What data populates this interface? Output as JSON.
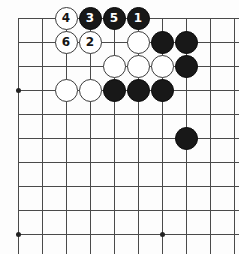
{
  "diagram": {
    "board": {
      "image_width": 239,
      "image_height": 254,
      "cell_size": 24,
      "origin_x": 18,
      "origin_y": 18,
      "columns": 10,
      "rows": 10,
      "line_color": "#4a4a4a",
      "background_color": "#fdfdfd",
      "black_color": "#181818",
      "white_color": "#ffffff"
    },
    "star_points": [
      {
        "col": 0,
        "row": 3
      },
      {
        "col": 0,
        "row": 9
      },
      {
        "col": 6,
        "row": 9
      }
    ],
    "stones": [
      {
        "col": 2,
        "row": 0,
        "color": "white",
        "label": "4"
      },
      {
        "col": 3,
        "row": 0,
        "color": "black",
        "label": "3"
      },
      {
        "col": 4,
        "row": 0,
        "color": "black",
        "label": "5"
      },
      {
        "col": 5,
        "row": 0,
        "color": "black",
        "label": "1"
      },
      {
        "col": 2,
        "row": 1,
        "color": "white",
        "label": "6"
      },
      {
        "col": 3,
        "row": 1,
        "color": "white",
        "label": "2"
      },
      {
        "col": 5,
        "row": 1,
        "color": "white",
        "label": ""
      },
      {
        "col": 6,
        "row": 1,
        "color": "black",
        "label": ""
      },
      {
        "col": 7,
        "row": 1,
        "color": "black",
        "label": ""
      },
      {
        "col": 4,
        "row": 2,
        "color": "white",
        "label": ""
      },
      {
        "col": 5,
        "row": 2,
        "color": "white",
        "label": ""
      },
      {
        "col": 6,
        "row": 2,
        "color": "white",
        "label": ""
      },
      {
        "col": 7,
        "row": 2,
        "color": "black",
        "label": ""
      },
      {
        "col": 2,
        "row": 3,
        "color": "white",
        "label": ""
      },
      {
        "col": 3,
        "row": 3,
        "color": "white",
        "label": ""
      },
      {
        "col": 4,
        "row": 3,
        "color": "black",
        "label": ""
      },
      {
        "col": 5,
        "row": 3,
        "color": "black",
        "label": ""
      },
      {
        "col": 6,
        "row": 3,
        "color": "black",
        "label": ""
      },
      {
        "col": 7,
        "row": 5,
        "color": "black",
        "label": ""
      }
    ],
    "move_labels": [
      "1",
      "2",
      "3",
      "4",
      "5",
      "6"
    ]
  }
}
